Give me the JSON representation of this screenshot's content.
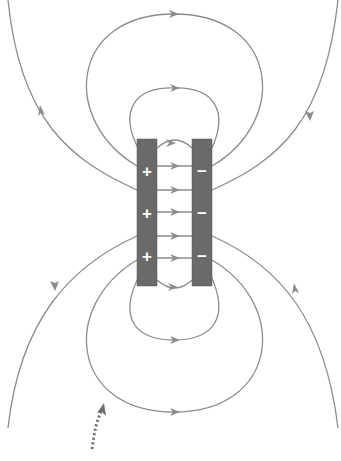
{
  "diagram": {
    "type": "electric field lines of a parallel-plate capacitor",
    "colors": {
      "field_line": "#8c8c8c",
      "plate": "#6a6a6a",
      "sign": "#ffffff",
      "pointer": "#6e6e6e"
    },
    "positive_plate": {
      "signs": [
        "+",
        "+",
        "+"
      ]
    },
    "negative_plate": {
      "signs": [
        "−",
        "−",
        "−"
      ]
    },
    "pointer": "dotted-arrow pointing to fringe field line"
  }
}
